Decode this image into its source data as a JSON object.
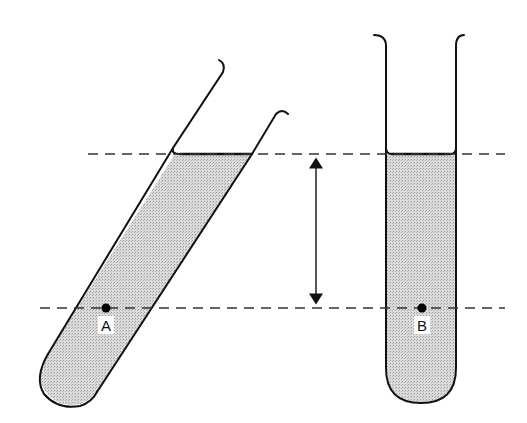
{
  "diagram": {
    "labels": {
      "point_a": "A",
      "point_b": "B"
    },
    "elements": {
      "tilted_tube": "tilted-test-tube",
      "upright_tube": "upright-test-tube",
      "surface_level_line": "top-dashed-line",
      "depth_level_line": "bottom-dashed-line",
      "depth_arrow": "double-headed vertical arrow between levels"
    },
    "colors": {
      "stroke": "#111111",
      "liquid_fill": "#d4d4d4",
      "background": "#ffffff"
    }
  }
}
